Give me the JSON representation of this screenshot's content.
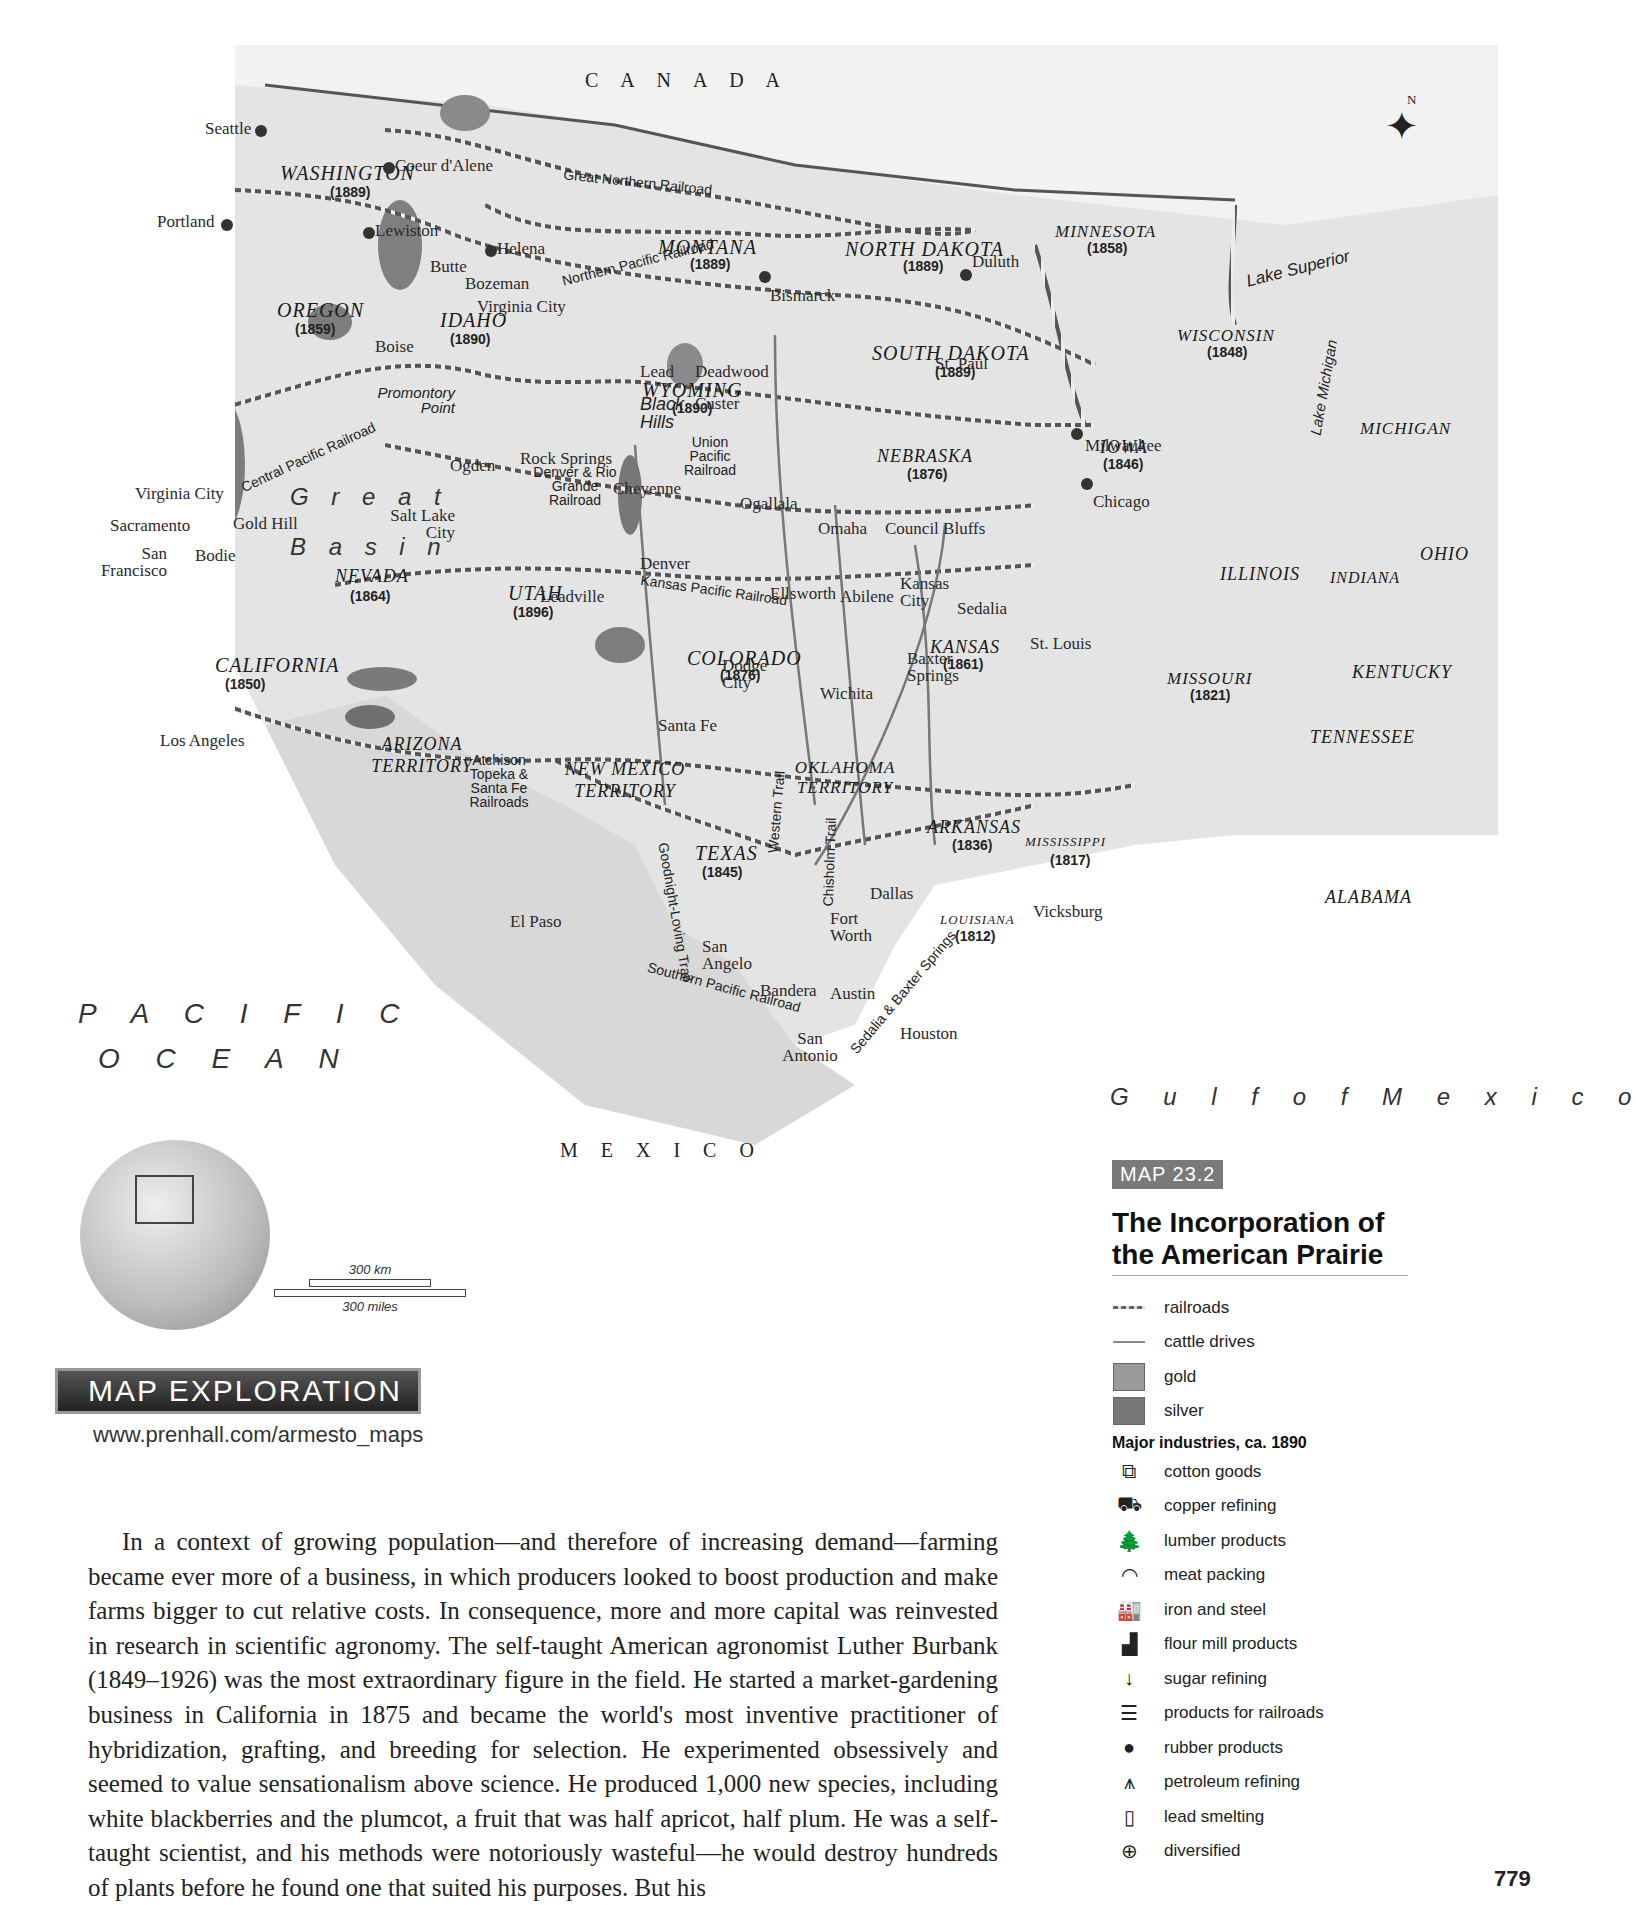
{
  "map": {
    "country_labels": {
      "canada": "C A N A D A",
      "mexico": "M E X I C O"
    },
    "ocean_labels": {
      "pacific_line1": "P A C I F I C",
      "pacific_line2": "O C E A N",
      "gulf": "G u l f   o f   M e x i c o"
    },
    "physical_labels": {
      "great": "G r e a t",
      "basin": "B a s i n",
      "lake_superior": "Lake Superior",
      "lake_michigan": "Lake Michigan",
      "mississippi": "Mississippi R.",
      "rio_grande": "Rio Grande",
      "promontory": "Promontory Point",
      "black_hills": "Black Hills",
      "rocky": "R O C K Y   M O U N T A I N S"
    },
    "compass": "N",
    "states": [
      {
        "name": "WASHINGTON",
        "year": "(1889)"
      },
      {
        "name": "OREGON",
        "year": "(1859)"
      },
      {
        "name": "IDAHO",
        "year": "(1890)"
      },
      {
        "name": "MONTANA",
        "year": "(1889)"
      },
      {
        "name": "NORTH DAKOTA",
        "year": "(1889)"
      },
      {
        "name": "MINNESOTA",
        "year": "(1858)"
      },
      {
        "name": "WISCONSIN",
        "year": "(1848)"
      },
      {
        "name": "SOUTH DAKOTA",
        "year": "(1889)"
      },
      {
        "name": "WYOMING",
        "year": "(1890)"
      },
      {
        "name": "NEBRASKA",
        "year": "(1876)"
      },
      {
        "name": "IOWA",
        "year": "(1846)"
      },
      {
        "name": "NEVADA",
        "year": "(1864)"
      },
      {
        "name": "UTAH",
        "year": "(1896)"
      },
      {
        "name": "CALIFORNIA",
        "year": "(1850)"
      },
      {
        "name": "COLORADO",
        "year": "(1876)"
      },
      {
        "name": "KANSAS",
        "year": "(1861)"
      },
      {
        "name": "MISSOURI",
        "year": "(1821)"
      },
      {
        "name": "ILLINOIS",
        "year": ""
      },
      {
        "name": "INDIANA",
        "year": ""
      },
      {
        "name": "OHIO",
        "year": ""
      },
      {
        "name": "MICHIGAN",
        "year": ""
      },
      {
        "name": "KENTUCKY",
        "year": ""
      },
      {
        "name": "TENNESSEE",
        "year": ""
      },
      {
        "name": "ARIZONA TERRITORY",
        "year": ""
      },
      {
        "name": "NEW MEXICO TERRITORY",
        "year": ""
      },
      {
        "name": "OKLAHOMA TERRITORY",
        "year": ""
      },
      {
        "name": "TEXAS",
        "year": "(1845)"
      },
      {
        "name": "ARKANSAS",
        "year": "(1836)"
      },
      {
        "name": "MISSISSIPPI",
        "year": "(1817)"
      },
      {
        "name": "LOUISIANA",
        "year": "(1812)"
      },
      {
        "name": "ALABAMA",
        "year": ""
      }
    ],
    "cities": [
      "Seattle",
      "Portland",
      "Coeur d'Alene",
      "Lewiston",
      "Helena",
      "Butte",
      "Bozeman",
      "Virginia City",
      "Boise",
      "Duluth",
      "Bismarck",
      "St. Paul",
      "Milwaukee",
      "Chicago",
      "Lead",
      "Deadwood",
      "Custer",
      "Ogden",
      "Rock Springs",
      "Cheyenne",
      "Salt Lake City",
      "Virginia City",
      "Gold Hill",
      "Sacramento",
      "San Francisco",
      "Bodie",
      "Ogallala",
      "Omaha",
      "Council Bluffs",
      "Denver",
      "Leadville",
      "Ellsworth",
      "Abilene",
      "Kansas City",
      "Sedalia",
      "St. Louis",
      "Dodge City",
      "Wichita",
      "Baxter Springs",
      "Los Angeles",
      "Santa Fe",
      "El Paso",
      "Dallas",
      "Fort Worth",
      "San Angelo",
      "Bandera",
      "Austin",
      "San Antonio",
      "Houston",
      "Vicksburg"
    ],
    "railroads": [
      "Great Northern Railroad",
      "Northern Pacific Railroad",
      "Central Pacific Railroad",
      "Union Pacific Railroad",
      "Denver & Rio Grande Railroad",
      "Kansas Pacific Railroad",
      "Atchison Topeka & Santa Fe Railroads",
      "Southern Pacific Railroad"
    ],
    "cattle_trails": [
      "Goodnight-Loving Trail",
      "Western Trail",
      "Chisholm Trail",
      "Sedalia & Baxter Springs"
    ],
    "scale": {
      "km": "300 km",
      "miles": "300 miles"
    }
  },
  "legend": {
    "tag": "MAP 23.2",
    "title": "The Incorporation of the American Prairie",
    "items": [
      {
        "icon": "railroad-line",
        "label": "railroads"
      },
      {
        "icon": "cattle-drive-line",
        "label": "cattle drives"
      },
      {
        "icon": "gold-swatch",
        "label": "gold",
        "color": "#9a9a9a"
      },
      {
        "icon": "silver-swatch",
        "label": "silver",
        "color": "#777777"
      }
    ],
    "industries_heading": "Major industries, ca. 1890",
    "industries": [
      {
        "icon": "cotton-goods-icon",
        "glyph": "⧉",
        "label": "cotton goods"
      },
      {
        "icon": "copper-refining-icon",
        "glyph": "⛟",
        "label": "copper refining"
      },
      {
        "icon": "lumber-icon",
        "glyph": "🌲",
        "label": "lumber products"
      },
      {
        "icon": "meat-packing-icon",
        "glyph": "◠",
        "label": "meat packing"
      },
      {
        "icon": "iron-steel-icon",
        "glyph": "🏭",
        "label": "iron and steel"
      },
      {
        "icon": "flour-mill-icon",
        "glyph": "▟",
        "label": "flour mill products"
      },
      {
        "icon": "sugar-refining-icon",
        "glyph": "↓",
        "label": "sugar refining"
      },
      {
        "icon": "railroad-products-icon",
        "glyph": "☰",
        "label": "products for railroads"
      },
      {
        "icon": "rubber-icon",
        "glyph": "●",
        "label": "rubber products"
      },
      {
        "icon": "petroleum-icon",
        "glyph": "⩚",
        "label": "petroleum refining"
      },
      {
        "icon": "lead-smelting-icon",
        "glyph": "▯",
        "label": "lead smelting"
      },
      {
        "icon": "diversified-icon",
        "glyph": "⊕",
        "label": "diversified"
      }
    ]
  },
  "exploration": {
    "title": "MAP EXPLORATION",
    "url": "www.prenhall.com/armesto_maps"
  },
  "body_text": "In a context of growing population—and therefore of increasing demand—farming became ever more of a business, in which producers looked to boost production and make farms bigger to cut relative costs. In consequence, more and more capital was reinvested in research in scientific agronomy. The self-taught American agronomist Luther Burbank (1849–1926) was the most extraordinary figure in the field. He started a market-gardening business in California in 1875 and became the world's most inventive practitioner of hybridization, grafting, and breeding for selection. He experimented obsessively and seemed to value sensationalism above science. He produced 1,000 new species, including white blackberries and the plumcot, a fruit that was half apricot, half plum. He was a self-taught scientist, and his methods were notoriously wasteful—he would destroy hundreds of plants before he found one that suited his purposes. But his",
  "page_number": "779"
}
